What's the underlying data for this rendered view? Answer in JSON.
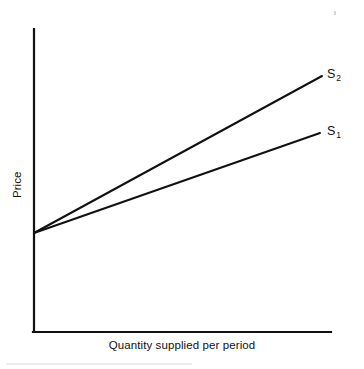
{
  "figure": {
    "kind": "economics-supply-curve-diagram",
    "width": 364,
    "height": 369,
    "background_color": "#ffffff",
    "ink_color": "#111111"
  },
  "axes": {
    "y_label": "Price",
    "x_label": "Quantity supplied per period",
    "axis_color": "#111111",
    "axis_line_width": 2,
    "origin_px": [
      33,
      332
    ],
    "y_axis_top_px": [
      33,
      29
    ],
    "x_axis_right_px": [
      331,
      332
    ],
    "ticks": [],
    "tick_labels": [],
    "grid": false
  },
  "series_labels": {
    "s1": {
      "letter": "S",
      "subscript": "1"
    },
    "s2": {
      "letter": "S",
      "subscript": "2"
    }
  },
  "chart_data": {
    "type": "line",
    "title": "",
    "subtitle": "",
    "xlabel": "Quantity supplied per period",
    "ylabel": "Price",
    "grid": false,
    "legend_position": "inline-right-end-of-line",
    "axis_ticks_labeled": false,
    "xlim": [
      0,
      1
    ],
    "ylim": [
      0,
      1
    ],
    "annotations": [
      "Both supply curves are upward sloping and share a common price intercept on the vertical axis.",
      "S2 is steeper (more elastic in quantity terms / rotated counter-clockwise about the intercept) than S1."
    ],
    "series": [
      {
        "name": "S₁",
        "label_text": "S1",
        "color": "#111111",
        "line_width": 2,
        "style": "solid",
        "x": [
          0.0,
          1.0
        ],
        "y": [
          0.326,
          0.657
        ],
        "px_points": [
          [
            34,
            233
          ],
          [
            320,
            133
          ]
        ],
        "slope_px_per_px": -0.3497,
        "description": "Flatter supply curve"
      },
      {
        "name": "S₂",
        "label_text": "S2",
        "color": "#111111",
        "line_width": 2,
        "style": "solid",
        "x": [
          0.0,
          1.0
        ],
        "y": [
          0.326,
          0.845
        ],
        "px_points": [
          [
            34,
            233
          ],
          [
            322,
            76
          ]
        ],
        "slope_px_per_px": -0.5451,
        "description": "Steeper supply curve, lies above S1 for all positive quantities"
      }
    ],
    "intercept": {
      "x": 0.0,
      "y": 0.326,
      "px": [
        34,
        233
      ],
      "shared_by": [
        "S₁",
        "S₂"
      ]
    }
  }
}
